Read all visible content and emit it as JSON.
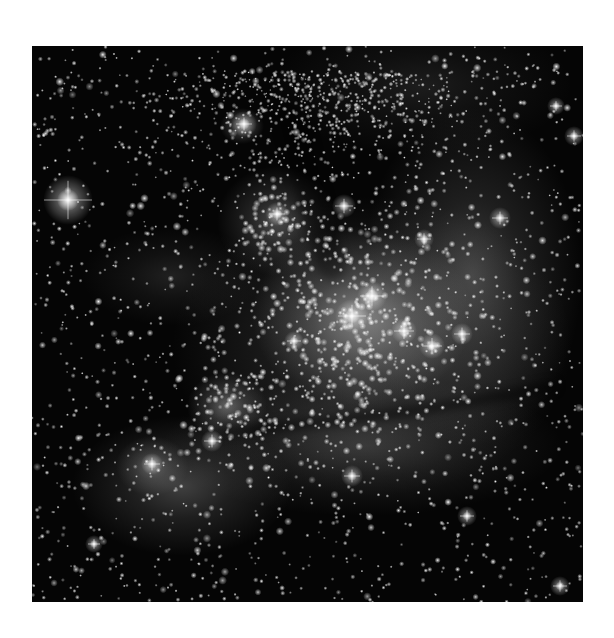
{
  "image": {
    "subject": "star-forming nebula with open star cluster",
    "colorMode": "grayscale",
    "frame": {
      "x": 32,
      "y": 46,
      "width": 551,
      "height": 556
    },
    "background": "#ffffff",
    "skyColor": "#050505"
  },
  "nebula": {
    "glows": [
      {
        "name": "central-cluster-core",
        "cx": 330,
        "cy": 270,
        "rx": 110,
        "ry": 90,
        "alpha": 0.55
      },
      {
        "name": "central-cluster-halo",
        "cx": 340,
        "cy": 300,
        "rx": 200,
        "ry": 150,
        "alpha": 0.28
      },
      {
        "name": "right-arc-shell",
        "cx": 440,
        "cy": 230,
        "rx": 110,
        "ry": 170,
        "alpha": 0.3
      },
      {
        "name": "upper-left-knot",
        "cx": 245,
        "cy": 175,
        "rx": 60,
        "ry": 55,
        "alpha": 0.35
      },
      {
        "name": "small-upper-knot",
        "cx": 210,
        "cy": 80,
        "rx": 22,
        "ry": 18,
        "alpha": 0.45
      },
      {
        "name": "left-lower-knot",
        "cx": 195,
        "cy": 360,
        "rx": 40,
        "ry": 34,
        "alpha": 0.45
      },
      {
        "name": "lower-left-cloud",
        "cx": 150,
        "cy": 440,
        "rx": 110,
        "ry": 70,
        "alpha": 0.3
      },
      {
        "name": "far-left-knot",
        "cx": 120,
        "cy": 420,
        "rx": 36,
        "ry": 30,
        "alpha": 0.38
      },
      {
        "name": "lower-band",
        "cx": 330,
        "cy": 400,
        "rx": 200,
        "ry": 70,
        "alpha": 0.22
      },
      {
        "name": "left-wisp",
        "cx": 140,
        "cy": 230,
        "rx": 90,
        "ry": 50,
        "alpha": 0.14
      },
      {
        "name": "dense-top-field",
        "cx": 390,
        "cy": 40,
        "rx": 150,
        "ry": 70,
        "alpha": 0.12
      }
    ],
    "dustLanes": [
      {
        "name": "diagonal-dust-lane",
        "x1": 190,
        "y1": 385,
        "x2": 520,
        "y2": 340,
        "width": 10,
        "alpha": 0.45
      },
      {
        "name": "upper-dark-channel",
        "x1": 260,
        "y1": 70,
        "x2": 300,
        "y2": 220,
        "width": 28,
        "alpha": 0.35
      }
    ]
  },
  "stars": {
    "seed": 346,
    "fieldCount": 1700,
    "clusterCount": 650,
    "denseTopCount": 700,
    "clusters": [
      {
        "cx": 330,
        "cy": 275,
        "sigma": 60,
        "weight": 0.5
      },
      {
        "cx": 245,
        "cy": 175,
        "sigma": 25,
        "weight": 0.12
      },
      {
        "cx": 195,
        "cy": 365,
        "sigma": 30,
        "weight": 0.12
      },
      {
        "cx": 300,
        "cy": 330,
        "sigma": 80,
        "weight": 0.26
      }
    ],
    "brightStars": [
      {
        "x": 36,
        "y": 154,
        "r": 5,
        "spike": 24
      },
      {
        "x": 320,
        "y": 270,
        "r": 3.4,
        "spike": 14
      },
      {
        "x": 340,
        "y": 250,
        "r": 3,
        "spike": 12
      },
      {
        "x": 372,
        "y": 285,
        "r": 2.6,
        "spike": 10
      },
      {
        "x": 400,
        "y": 300,
        "r": 2.6,
        "spike": 10
      },
      {
        "x": 312,
        "y": 160,
        "r": 2.4,
        "spike": 9
      },
      {
        "x": 212,
        "y": 78,
        "r": 2.6,
        "spike": 8
      },
      {
        "x": 245,
        "y": 168,
        "r": 2.4,
        "spike": 8
      },
      {
        "x": 468,
        "y": 172,
        "r": 2.2,
        "spike": 8
      },
      {
        "x": 430,
        "y": 288,
        "r": 2.2,
        "spike": 8
      },
      {
        "x": 392,
        "y": 193,
        "r": 2.0,
        "spike": 7
      },
      {
        "x": 180,
        "y": 395,
        "r": 2.2,
        "spike": 8
      },
      {
        "x": 120,
        "y": 418,
        "r": 2.2,
        "spike": 8
      },
      {
        "x": 320,
        "y": 430,
        "r": 2.2,
        "spike": 8
      },
      {
        "x": 435,
        "y": 470,
        "r": 2.0,
        "spike": 7
      },
      {
        "x": 528,
        "y": 540,
        "r": 2.0,
        "spike": 7
      },
      {
        "x": 542,
        "y": 90,
        "r": 2.0,
        "spike": 7
      },
      {
        "x": 524,
        "y": 60,
        "r": 1.8,
        "spike": 6
      },
      {
        "x": 62,
        "y": 498,
        "r": 1.8,
        "spike": 6
      },
      {
        "x": 262,
        "y": 295,
        "r": 2.0,
        "spike": 7
      }
    ]
  }
}
